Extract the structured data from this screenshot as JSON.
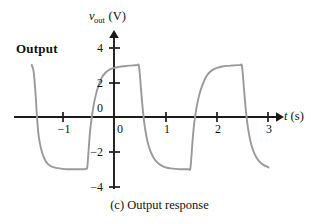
{
  "figure": {
    "caption": "(c) Output response",
    "series_label": "Output",
    "axis_color": "#1a1a1a",
    "curve_color": "#9a9a9a",
    "text_color": "#111111"
  },
  "chart_data": {
    "type": "line",
    "title": "(c) Output response",
    "xlabel": "t (s)",
    "ylabel": "v_out (V)",
    "ylabel_base": "v",
    "ylabel_sub": "out",
    "ylabel_unit": "(V)",
    "xlabel_var": "t",
    "xlabel_unit": "(s)",
    "xlim": [
      -1.6,
      3.3
    ],
    "ylim": [
      -4.6,
      4.6
    ],
    "xticks": [
      -1,
      0,
      1,
      2,
      3
    ],
    "xtick_labels": [
      "−1",
      "0",
      "1",
      "2",
      "3"
    ],
    "yticks": [
      4,
      2,
      0,
      -2,
      -4
    ],
    "ytick_labels": [
      "4",
      "2",
      "0",
      "−2",
      "−4"
    ],
    "grid": false,
    "legend": "none",
    "annotations": [
      {
        "text": "Output",
        "x": -1.35,
        "y": 3.6
      }
    ],
    "period_s": 2,
    "amplitude_v": 3,
    "transition_times_s": [
      -1.5,
      -0.5,
      0.5,
      1.5,
      2.5
    ],
    "series": [
      {
        "name": "Output",
        "x": [
          -1.6,
          -1.56,
          -1.52,
          -1.5,
          -1.47,
          -1.44,
          -1.4,
          -1.35,
          -1.3,
          -1.24,
          -1.18,
          -1.1,
          -1.0,
          -0.9,
          -0.8,
          -0.7,
          -0.6,
          -0.55,
          -0.52,
          -0.5,
          -0.47,
          -0.44,
          -0.4,
          -0.35,
          -0.3,
          -0.24,
          -0.18,
          -0.1,
          0.0,
          0.1,
          0.2,
          0.3,
          0.4,
          0.45,
          0.48,
          0.5,
          0.53,
          0.56,
          0.6,
          0.65,
          0.7,
          0.76,
          0.82,
          0.9,
          1.0,
          1.1,
          1.2,
          1.3,
          1.4,
          1.45,
          1.48,
          1.5,
          1.53,
          1.56,
          1.6,
          1.65,
          1.7,
          1.76,
          1.82,
          1.9,
          2.0,
          2.1,
          2.2,
          2.3,
          2.4,
          2.45,
          2.48,
          2.5,
          2.53,
          2.56,
          2.6,
          2.65,
          2.7,
          2.76,
          2.82,
          2.9,
          3.0
        ],
        "y": [
          3.0,
          2.6,
          1.2,
          0.2,
          -0.9,
          -1.5,
          -2.0,
          -2.4,
          -2.65,
          -2.8,
          -2.88,
          -2.94,
          -2.98,
          -3.0,
          -3.0,
          -3.0,
          -3.0,
          -2.98,
          -2.9,
          -2.2,
          -1.0,
          -0.2,
          0.6,
          1.3,
          1.8,
          2.25,
          2.5,
          2.7,
          2.82,
          2.88,
          2.92,
          2.95,
          2.97,
          2.98,
          2.98,
          2.5,
          1.4,
          0.4,
          -0.6,
          -1.4,
          -1.9,
          -2.3,
          -2.55,
          -2.75,
          -2.9,
          -2.95,
          -2.98,
          -3.0,
          -3.0,
          -3.0,
          -3.0,
          -2.4,
          -1.2,
          -0.3,
          0.5,
          1.2,
          1.7,
          2.15,
          2.45,
          2.68,
          2.82,
          2.9,
          2.94,
          2.96,
          2.98,
          2.98,
          2.98,
          2.5,
          1.4,
          0.4,
          -0.6,
          -1.4,
          -1.9,
          -2.3,
          -2.55,
          -2.75,
          -2.9
        ]
      }
    ]
  }
}
